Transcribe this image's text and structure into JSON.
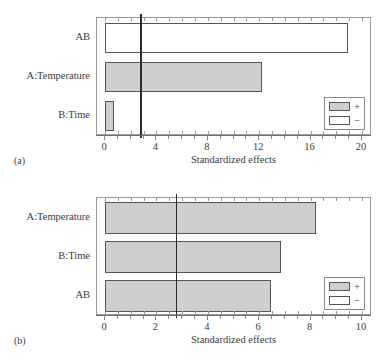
{
  "figure": {
    "panels": [
      {
        "caption": "(a)",
        "axis_title": "Standardized effects",
        "legend": {
          "plus_label": "+",
          "minus_label": "−"
        },
        "chart_data": {
          "type": "bar",
          "orientation": "horizontal",
          "title": "",
          "xlabel": "Standardized effects",
          "ylabel": "",
          "categories": [
            "AB",
            "A:Temperature",
            "B:Time"
          ],
          "values": [
            18.9,
            12.2,
            0.7
          ],
          "signs": [
            "-",
            "+",
            "+"
          ],
          "xlim": [
            0,
            20
          ],
          "xticks": [
            0,
            4,
            8,
            12,
            16,
            20
          ],
          "xticklabels": [
            "0",
            "4",
            "8",
            "12",
            "16",
            "20"
          ],
          "reference_line": 2.75,
          "grid": false,
          "legend_position": "lower right"
        }
      },
      {
        "caption": "(b)",
        "axis_title": "Standardized effects",
        "legend": {
          "plus_label": "+",
          "minus_label": "−"
        },
        "chart_data": {
          "type": "bar",
          "orientation": "horizontal",
          "title": "",
          "xlabel": "Standardized effects",
          "ylabel": "",
          "categories": [
            "A:Temperature",
            "B:Time",
            "AB"
          ],
          "values": [
            8.2,
            6.85,
            6.45
          ],
          "signs": [
            "+",
            "+",
            "+"
          ],
          "xlim": [
            0,
            10
          ],
          "xticks": [
            0,
            2,
            4,
            6,
            8,
            10
          ],
          "xticklabels": [
            "0",
            "2",
            "4",
            "6",
            "8",
            "10"
          ],
          "reference_line": 2.75,
          "grid": false,
          "legend_position": "lower right"
        }
      }
    ],
    "colors": {
      "plus_fill": "#cfcfcf",
      "minus_fill": "#ffffff",
      "bar_edge": "#555555",
      "frame": "#9a9a9a",
      "reference_line": "#2b2b2b",
      "text": "#3b3b3b"
    }
  }
}
